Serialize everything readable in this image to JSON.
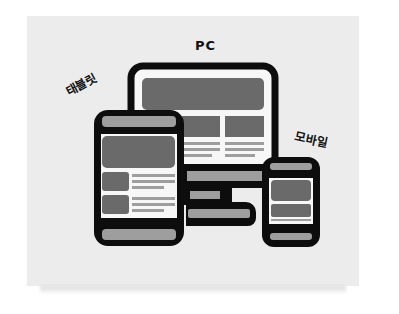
{
  "labels": {
    "pc": "PC",
    "tablet": "태블릿",
    "mobile": "모바일"
  },
  "devices": [
    {
      "name": "pc",
      "type": "monitor"
    },
    {
      "name": "tablet",
      "type": "tablet"
    },
    {
      "name": "mobile",
      "type": "phone"
    }
  ],
  "colors": {
    "background": "#ffffff",
    "card": "#ececec",
    "outline": "#0d0d0d",
    "screen": "#f7f7f7",
    "block_dark": "#6a6a6a",
    "block_light": "#9e9e9e"
  }
}
